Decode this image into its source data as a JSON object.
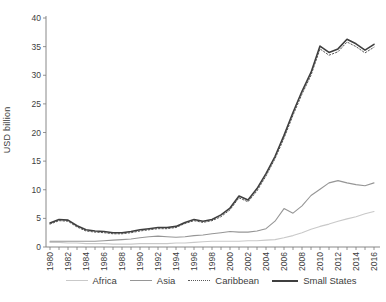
{
  "chart_data": {
    "type": "line",
    "title": "",
    "xlabel": "",
    "ylabel": "USD billion",
    "ylim": [
      0,
      40
    ],
    "ytick_step": 5,
    "xtick_label_every": 2,
    "grid": false,
    "legend_position": "bottom",
    "axis_color": "#7a7a7a",
    "tick_label_color": "#404040",
    "x": [
      1980,
      1981,
      1982,
      1983,
      1984,
      1985,
      1986,
      1987,
      1988,
      1989,
      1990,
      1991,
      1992,
      1993,
      1994,
      1995,
      1996,
      1997,
      1998,
      1999,
      2000,
      2001,
      2002,
      2003,
      2004,
      2005,
      2006,
      2007,
      2008,
      2009,
      2010,
      2011,
      2012,
      2013,
      2014,
      2015,
      2016
    ],
    "series": [
      {
        "name": "Africa",
        "color": "#c9c9c9",
        "style": "solid",
        "width": 1.1,
        "values": [
          0.8,
          0.8,
          0.7,
          0.7,
          0.6,
          0.6,
          0.6,
          0.5,
          0.5,
          0.5,
          0.6,
          0.6,
          0.6,
          0.6,
          0.7,
          0.7,
          0.8,
          0.9,
          1.0,
          1.0,
          1.0,
          1.0,
          1.1,
          1.1,
          1.2,
          1.3,
          1.6,
          2.0,
          2.5,
          3.1,
          3.6,
          4.0,
          4.5,
          4.9,
          5.3,
          5.8,
          6.2
        ]
      },
      {
        "name": "Asia",
        "color": "#969696",
        "style": "solid",
        "width": 1.1,
        "values": [
          1.0,
          1.0,
          1.0,
          1.0,
          1.0,
          1.0,
          1.1,
          1.2,
          1.3,
          1.4,
          1.6,
          1.8,
          1.9,
          1.8,
          1.7,
          1.8,
          2.0,
          2.1,
          2.3,
          2.5,
          2.7,
          2.6,
          2.6,
          2.8,
          3.2,
          4.5,
          6.7,
          5.9,
          7.2,
          9.0,
          10.1,
          11.2,
          11.6,
          11.2,
          10.9,
          10.7,
          11.2
        ]
      },
      {
        "name": "Caribbean",
        "color": "#595959",
        "style": "dotted",
        "width": 1.0,
        "values": [
          4.0,
          4.6,
          4.5,
          3.5,
          2.8,
          2.6,
          2.5,
          2.3,
          2.3,
          2.5,
          2.8,
          3.0,
          3.2,
          3.2,
          3.4,
          4.1,
          4.6,
          4.3,
          4.6,
          5.3,
          6.5,
          8.6,
          7.9,
          9.8,
          12.4,
          15.4,
          19.0,
          23.0,
          26.7,
          30.0,
          34.6,
          33.5,
          34.1,
          35.8,
          35.0,
          33.9,
          34.9
        ]
      },
      {
        "name": "Small States",
        "color": "#3f3f3f",
        "style": "solid",
        "width": 1.6,
        "values": [
          4.2,
          4.8,
          4.7,
          3.7,
          3.0,
          2.8,
          2.7,
          2.5,
          2.5,
          2.7,
          3.0,
          3.2,
          3.4,
          3.4,
          3.6,
          4.3,
          4.8,
          4.5,
          4.8,
          5.6,
          6.8,
          8.9,
          8.2,
          10.2,
          12.8,
          15.8,
          19.5,
          23.5,
          27.2,
          30.5,
          35.1,
          34.0,
          34.6,
          36.3,
          35.5,
          34.4,
          35.4
        ]
      }
    ]
  }
}
